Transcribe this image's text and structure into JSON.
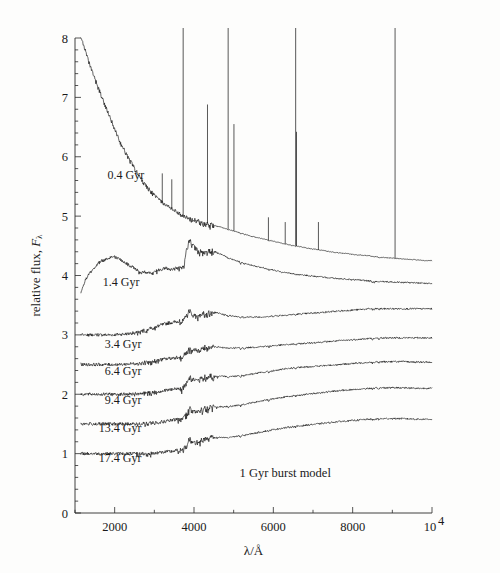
{
  "figure": {
    "background_color": "#fdfdfc",
    "ink_color": "#111111"
  },
  "chart_data": {
    "type": "line",
    "title": "",
    "subtitle": "",
    "xlabel": "λ/Å",
    "ylabel": "relative flux, Fλ",
    "xlim": [
      1000,
      10000
    ],
    "ylim": [
      0,
      8
    ],
    "grid": false,
    "legend_position": "inline-annotations",
    "x_ticks": [
      2000,
      4000,
      6000,
      8000,
      10000
    ],
    "x_tick_labels": [
      "2000",
      "4000",
      "6000",
      "8000",
      "10⁴"
    ],
    "x_minor_tick_step": 1000,
    "y_ticks": [
      0,
      1,
      2,
      3,
      4,
      5,
      6,
      7,
      8
    ],
    "y_tick_labels": [
      "0",
      "1",
      "2",
      "3",
      "4",
      "5",
      "6",
      "7",
      "8"
    ],
    "y_minor_tick_step": 0.2,
    "annotations": [
      {
        "text": "1 Gyr burst model",
        "x": 6300,
        "y": 0.6
      }
    ],
    "series": [
      {
        "name": "0.4 Gyr",
        "label": "0.4 Gyr",
        "label_x": 1820,
        "label_y": 5.62,
        "baseline_offset": 4.25,
        "has_emission_lines": true,
        "x": [
          1150,
          1250,
          1350,
          1450,
          1550,
          1650,
          1750,
          1850,
          1950,
          2050,
          2150,
          2250,
          2350,
          2450,
          2550,
          2650,
          2750,
          2850,
          2950,
          3050,
          3150,
          3250,
          3350,
          3450,
          3550,
          3650,
          3750,
          3850,
          3950,
          4050,
          4150,
          4250,
          4350,
          4450,
          4550,
          4650,
          4750,
          4850,
          4950,
          5050,
          5250,
          5450,
          5650,
          5850,
          6050,
          6250,
          6450,
          6650,
          6850,
          7050,
          7250,
          7450,
          7650,
          7850,
          8050,
          8250,
          8450,
          8650,
          8850,
          9050,
          9250,
          9450,
          9650,
          9850,
          10000
        ],
        "y": [
          8.05,
          7.8,
          7.58,
          7.4,
          7.22,
          7.05,
          6.88,
          6.7,
          6.55,
          6.38,
          6.22,
          6.1,
          5.97,
          5.86,
          5.74,
          5.64,
          5.54,
          5.46,
          5.38,
          5.32,
          5.26,
          5.2,
          5.16,
          5.12,
          5.08,
          5.04,
          5.0,
          4.98,
          4.96,
          4.94,
          4.92,
          4.9,
          4.88,
          4.86,
          4.84,
          4.82,
          4.8,
          4.78,
          4.76,
          4.74,
          4.7,
          4.66,
          4.63,
          4.6,
          4.57,
          4.54,
          4.51,
          4.49,
          4.46,
          4.44,
          4.42,
          4.4,
          4.38,
          4.37,
          4.35,
          4.34,
          4.33,
          4.31,
          4.3,
          4.29,
          4.28,
          4.27,
          4.26,
          4.25,
          4.25
        ],
        "emission_lines": [
          {
            "wavelength": 3727,
            "peak": 8.22
          },
          {
            "wavelength": 4340,
            "peak": 6.88
          },
          {
            "wavelength": 4861,
            "peak": 8.22
          },
          {
            "wavelength": 5007,
            "peak": 6.55
          },
          {
            "wavelength": 6563,
            "peak": 8.22
          },
          {
            "wavelength": 6584,
            "peak": 6.42
          },
          {
            "wavelength": 9069,
            "peak": 8.18
          },
          {
            "wavelength": 3200,
            "peak": 5.72
          },
          {
            "wavelength": 3440,
            "peak": 5.62
          },
          {
            "wavelength": 5876,
            "peak": 4.98
          },
          {
            "wavelength": 6300,
            "peak": 4.9
          },
          {
            "wavelength": 7137,
            "peak": 4.9
          }
        ]
      },
      {
        "name": "1.4 Gyr",
        "label": "1.4 Gyr",
        "label_x": 1700,
        "label_y": 3.82,
        "baseline_offset": 3.85,
        "has_emission_lines": false,
        "x": [
          1150,
          1250,
          1350,
          1450,
          1550,
          1650,
          1750,
          1850,
          1950,
          2050,
          2150,
          2250,
          2350,
          2450,
          2550,
          2650,
          2750,
          2850,
          2950,
          3050,
          3150,
          3250,
          3350,
          3450,
          3550,
          3650,
          3750,
          3800,
          3850,
          3900,
          3950,
          4000,
          4100,
          4200,
          4300,
          4400,
          4500,
          4600,
          4800,
          5000,
          5400,
          5800,
          6200,
          6600,
          7000,
          7400,
          7800,
          8200,
          8600,
          9000,
          9400,
          9800,
          10000
        ],
        "y": [
          3.72,
          3.9,
          4.02,
          4.1,
          4.18,
          4.24,
          4.26,
          4.3,
          4.32,
          4.3,
          4.26,
          4.22,
          4.18,
          4.14,
          4.1,
          4.08,
          4.06,
          4.05,
          4.06,
          4.08,
          4.1,
          4.12,
          4.12,
          4.1,
          4.12,
          4.14,
          4.18,
          4.42,
          4.55,
          4.6,
          4.58,
          4.5,
          4.44,
          4.4,
          4.42,
          4.44,
          4.42,
          4.38,
          4.32,
          4.26,
          4.18,
          4.12,
          4.06,
          4.02,
          3.99,
          3.96,
          3.94,
          3.92,
          3.9,
          3.89,
          3.88,
          3.87,
          3.86
        ]
      },
      {
        "name": "3.4 Gyr",
        "label": "3.4 Gyr",
        "label_x": 1750,
        "label_y": 2.78,
        "baseline_offset": 3.0,
        "has_emission_lines": false,
        "x": [
          1150,
          1350,
          1550,
          1750,
          1950,
          2150,
          2350,
          2550,
          2750,
          2950,
          3150,
          3350,
          3550,
          3700,
          3800,
          3850,
          3900,
          3950,
          4050,
          4150,
          4250,
          4350,
          4450,
          4550,
          4750,
          4950,
          5250,
          5650,
          6050,
          6450,
          6850,
          7250,
          7650,
          8050,
          8450,
          8850,
          9250,
          9650,
          10000
        ],
        "y": [
          3.0,
          3.0,
          3.0,
          3.0,
          3.0,
          3.01,
          3.02,
          3.04,
          3.08,
          3.12,
          3.16,
          3.2,
          3.22,
          3.24,
          3.32,
          3.4,
          3.42,
          3.38,
          3.32,
          3.34,
          3.38,
          3.4,
          3.4,
          3.38,
          3.34,
          3.32,
          3.3,
          3.3,
          3.32,
          3.34,
          3.36,
          3.38,
          3.4,
          3.42,
          3.44,
          3.44,
          3.44,
          3.44,
          3.44
        ]
      },
      {
        "name": "6.4 Gyr",
        "label": "6.4 Gyr",
        "label_x": 1750,
        "label_y": 2.32,
        "baseline_offset": 2.5,
        "has_emission_lines": false,
        "x": [
          1150,
          1350,
          1550,
          1750,
          1950,
          2150,
          2350,
          2550,
          2750,
          2950,
          3150,
          3350,
          3550,
          3700,
          3800,
          3850,
          3900,
          3950,
          4050,
          4150,
          4250,
          4350,
          4450,
          4550,
          4750,
          4950,
          5250,
          5650,
          6050,
          6450,
          6850,
          7250,
          7650,
          8050,
          8450,
          8850,
          9250,
          9650,
          10000
        ],
        "y": [
          2.5,
          2.5,
          2.5,
          2.5,
          2.5,
          2.5,
          2.51,
          2.52,
          2.54,
          2.56,
          2.58,
          2.6,
          2.62,
          2.64,
          2.7,
          2.76,
          2.8,
          2.78,
          2.74,
          2.76,
          2.8,
          2.82,
          2.82,
          2.8,
          2.78,
          2.78,
          2.78,
          2.8,
          2.82,
          2.84,
          2.86,
          2.88,
          2.9,
          2.92,
          2.94,
          2.95,
          2.95,
          2.95,
          2.95
        ]
      },
      {
        "name": "9.4 Gyr",
        "label": "9.4 Gyr",
        "label_x": 1750,
        "label_y": 1.84,
        "baseline_offset": 2.0,
        "has_emission_lines": false,
        "x": [
          1150,
          1350,
          1550,
          1750,
          1950,
          2150,
          2350,
          2550,
          2750,
          2950,
          3150,
          3350,
          3550,
          3700,
          3800,
          3850,
          3900,
          3950,
          4050,
          4150,
          4250,
          4350,
          4450,
          4550,
          4750,
          4950,
          5250,
          5650,
          6050,
          6450,
          6850,
          7250,
          7650,
          8050,
          8450,
          8850,
          9250,
          9650,
          10000
        ],
        "y": [
          2.0,
          2.0,
          2.0,
          2.0,
          2.0,
          2.0,
          2.0,
          2.01,
          2.02,
          2.03,
          2.05,
          2.07,
          2.09,
          2.11,
          2.18,
          2.26,
          2.3,
          2.28,
          2.24,
          2.26,
          2.3,
          2.32,
          2.32,
          2.3,
          2.3,
          2.3,
          2.32,
          2.36,
          2.4,
          2.44,
          2.46,
          2.48,
          2.5,
          2.52,
          2.54,
          2.55,
          2.55,
          2.54,
          2.54
        ]
      },
      {
        "name": "13.4 Gyr",
        "label": "13.4 Gyr",
        "label_x": 1600,
        "label_y": 1.36,
        "baseline_offset": 1.5,
        "has_emission_lines": false,
        "x": [
          1150,
          1350,
          1550,
          1750,
          1950,
          2150,
          2350,
          2550,
          2750,
          2950,
          3150,
          3350,
          3550,
          3700,
          3800,
          3850,
          3900,
          3950,
          4050,
          4150,
          4250,
          4350,
          4450,
          4550,
          4750,
          4950,
          5250,
          5650,
          6050,
          6450,
          6850,
          7250,
          7650,
          8050,
          8450,
          8850,
          9250,
          9650,
          10000
        ],
        "y": [
          1.5,
          1.5,
          1.5,
          1.5,
          1.5,
          1.5,
          1.5,
          1.5,
          1.51,
          1.52,
          1.53,
          1.55,
          1.57,
          1.59,
          1.66,
          1.74,
          1.78,
          1.76,
          1.72,
          1.74,
          1.78,
          1.8,
          1.8,
          1.79,
          1.79,
          1.8,
          1.83,
          1.88,
          1.93,
          1.97,
          2.0,
          2.03,
          2.06,
          2.08,
          2.1,
          2.11,
          2.11,
          2.1,
          2.1
        ]
      },
      {
        "name": "17.4 Gyr",
        "label": "17.4 Gyr",
        "label_x": 1600,
        "label_y": 0.86,
        "baseline_offset": 1.0,
        "has_emission_lines": false,
        "x": [
          1150,
          1350,
          1550,
          1750,
          1950,
          2150,
          2350,
          2550,
          2750,
          2950,
          3150,
          3350,
          3550,
          3700,
          3800,
          3850,
          3900,
          3950,
          4050,
          4150,
          4250,
          4350,
          4450,
          4550,
          4750,
          4950,
          5250,
          5650,
          6050,
          6450,
          6850,
          7250,
          7650,
          8050,
          8450,
          8850,
          9250,
          9650,
          10000
        ],
        "y": [
          1.0,
          1.0,
          1.0,
          1.0,
          1.0,
          1.0,
          1.0,
          1.0,
          1.0,
          1.01,
          1.02,
          1.03,
          1.05,
          1.07,
          1.14,
          1.22,
          1.26,
          1.24,
          1.2,
          1.22,
          1.26,
          1.28,
          1.28,
          1.27,
          1.27,
          1.28,
          1.31,
          1.36,
          1.41,
          1.45,
          1.48,
          1.51,
          1.54,
          1.56,
          1.58,
          1.59,
          1.59,
          1.58,
          1.58
        ]
      }
    ]
  }
}
